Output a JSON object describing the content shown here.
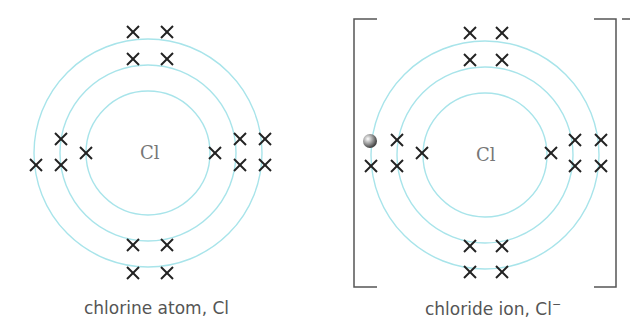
{
  "diagrams": [
    {
      "id": "atom",
      "center_symbol": "Cl",
      "caption": "chlorine atom, Cl",
      "shells": [
        2,
        8,
        7
      ],
      "extra_electron": false
    },
    {
      "id": "ion",
      "center_symbol": "Cl",
      "caption_prefix": "chloride ion, Cl",
      "caption_superscript": "−",
      "charge": "−",
      "shells": [
        2,
        8,
        8
      ],
      "extra_electron": true
    }
  ],
  "colors": {
    "shell": "#a8e4ea",
    "electron_cross": "#222222",
    "bracket": "#555555",
    "text": "#555555",
    "extra_electron": "#888888"
  }
}
